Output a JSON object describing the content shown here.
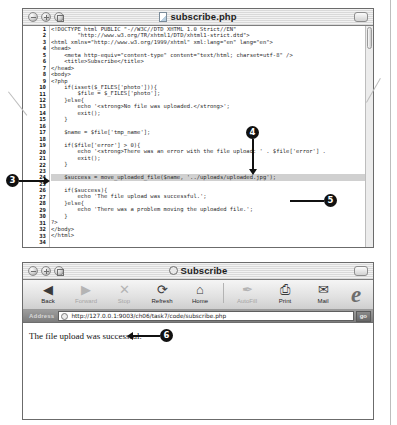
{
  "editor": {
    "title": "subscribe.php",
    "doc_icon": "document-icon",
    "window_controls": [
      "close-icon",
      "minimize-icon",
      "zoom-icon"
    ],
    "code": [
      {
        "n": 1,
        "text": "<!DOCTYPE html PUBLIC \"-//W3C//DTD XHTML 1.0 Strict//EN\""
      },
      {
        "n": 2,
        "text": "        \"http://www.w3.org/TR/xhtml1/DTD/xhtml1-strict.dtd\">"
      },
      {
        "n": 3,
        "text": "<html xmlns=\"http://www.w3.org/1999/xhtml\" xml:lang=\"en\" lang=\"en\">"
      },
      {
        "n": 4,
        "text": "<head>"
      },
      {
        "n": 5,
        "text": "    <meta http-equiv=\"content-type\" content=\"text/html; charset=utf-8\" />"
      },
      {
        "n": 6,
        "text": "    <title>Subscribe</title>"
      },
      {
        "n": 7,
        "text": "</head>"
      },
      {
        "n": 8,
        "text": "<body>"
      },
      {
        "n": 9,
        "text": "<?php"
      },
      {
        "n": 10,
        "text": "    if(isset($_FILES['photo'])){"
      },
      {
        "n": 11,
        "text": "        $file = $_FILES['photo'];"
      },
      {
        "n": 12,
        "text": "    }else{"
      },
      {
        "n": 13,
        "text": "        echo '<strong>No file was uploaded.</strong>';"
      },
      {
        "n": 14,
        "text": "        exit();"
      },
      {
        "n": 15,
        "text": "    }"
      },
      {
        "n": 16,
        "text": ""
      },
      {
        "n": 17,
        "text": "    $name = $file['tmp_name'];"
      },
      {
        "n": 18,
        "text": ""
      },
      {
        "n": 19,
        "text": "    if($file['error'] > 0){"
      },
      {
        "n": 20,
        "text": "        echo '<strong>There was an error with the file upload: ' . $file['error'] ."
      },
      {
        "n": 21,
        "text": "        exit();"
      },
      {
        "n": 22,
        "text": "    }"
      },
      {
        "n": 23,
        "text": ""
      },
      {
        "n": 24,
        "text": "    $success = move_uploaded_file($name, '../uploads/uploaded.jpg');",
        "highlight": true
      },
      {
        "n": 25,
        "text": ""
      },
      {
        "n": 26,
        "text": "    if($success){"
      },
      {
        "n": 27,
        "text": "        echo 'The file upload was successful.';"
      },
      {
        "n": 28,
        "text": "    }else{"
      },
      {
        "n": 29,
        "text": "        echo 'There was a problem moving the uploaded file.';"
      },
      {
        "n": 30,
        "text": "    }"
      },
      {
        "n": 31,
        "text": "?>"
      },
      {
        "n": 32,
        "text": "</body>"
      },
      {
        "n": 33,
        "text": "</html>"
      },
      {
        "n": 34,
        "text": ""
      }
    ]
  },
  "browser": {
    "title": "Subscribe",
    "title_icon": "ie-page-icon",
    "window_controls": [
      "close-icon",
      "minimize-icon",
      "zoom-icon"
    ],
    "toolbar": [
      {
        "label": "Back",
        "icon": "back-arrow-icon",
        "glyph": "◀",
        "disabled": false
      },
      {
        "label": "Forward",
        "icon": "forward-arrow-icon",
        "glyph": "▶",
        "disabled": true
      },
      {
        "label": "Stop",
        "icon": "stop-x-icon",
        "glyph": "✕",
        "disabled": true
      },
      {
        "label": "Refresh",
        "icon": "refresh-icon",
        "glyph": "⟳",
        "disabled": false
      },
      {
        "label": "Home",
        "icon": "home-icon",
        "glyph": "⌂",
        "disabled": false
      },
      {
        "label": "AutoFill",
        "icon": "autofill-pen-icon",
        "glyph": "✒",
        "disabled": true
      },
      {
        "label": "Print",
        "icon": "printer-icon",
        "glyph": "⎙",
        "disabled": false
      },
      {
        "label": "Mail",
        "icon": "mail-envelope-icon",
        "glyph": "✉",
        "disabled": false
      }
    ],
    "brand_logo": "internet-explorer-logo",
    "brand_letter": "e",
    "address_label": "Address",
    "address_value": "http://127.0.0.1:9003/ch06/task7/code/subscribe.php",
    "address_icon": "globe-icon",
    "go_label": "go",
    "page_text": "The file upload was successful."
  },
  "callouts": [
    {
      "id": "3",
      "label": "3"
    },
    {
      "id": "4",
      "label": "4"
    },
    {
      "id": "5",
      "label": "5"
    },
    {
      "id": "6",
      "label": "6"
    }
  ]
}
